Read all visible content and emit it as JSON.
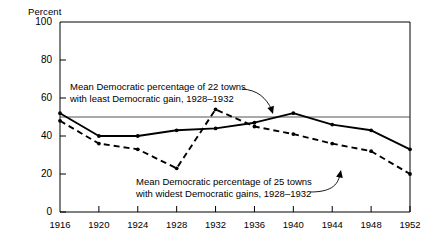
{
  "chart_data": {
    "type": "line",
    "title": "",
    "xlabel": "",
    "ylabel": "Percent",
    "ylim": [
      0,
      100
    ],
    "yticks": [
      0,
      20,
      40,
      60,
      80,
      100
    ],
    "xlim": [
      1916,
      1952
    ],
    "grid": false,
    "legend_position": "annotations-inline",
    "categories": [
      1916,
      1920,
      1924,
      1928,
      1932,
      1936,
      1940,
      1944,
      1948,
      1952
    ],
    "xtick_labels": [
      "1916",
      "1920",
      "1924",
      "1928",
      "1932",
      "1936",
      "1940",
      "1944",
      "1948",
      "1952"
    ],
    "ytick_labels": [
      "0",
      "20",
      "40",
      "60",
      "80",
      "100"
    ],
    "series": [
      {
        "name": "Mean Democratic percentage of 22 towns with least Democratic gain, 1928-1932",
        "style": "solid",
        "color": "#000000",
        "values": [
          52,
          40,
          40,
          43,
          44,
          47,
          52,
          46,
          43,
          33
        ]
      },
      {
        "name": "Mean Democratic percentage of 25 towns with widest Democratic gains, 1928-1932",
        "style": "dashed",
        "color": "#000000",
        "values": [
          48,
          36,
          33,
          23,
          54,
          45,
          41,
          36,
          32,
          20
        ]
      }
    ],
    "reference_lines": [
      {
        "name": "fifty-percent-line",
        "orientation": "horizontal",
        "value": 50,
        "color": "#555555"
      }
    ],
    "annotations": [
      {
        "name": "annotation-least-gain",
        "line1": "Mean Democratic percentage of 22 towns",
        "line2": "with least Democratic gain, 1928–1932",
        "points_to": {
          "x": 1934,
          "y": 49
        }
      },
      {
        "name": "annotation-widest-gain",
        "line1": "Mean Democratic percentage of 25 towns",
        "line2": "with widest Democratic gains, 1928–1932",
        "points_to": {
          "x": 1946,
          "y": 34
        }
      }
    ]
  },
  "axis": {
    "y_title": "Percent"
  }
}
